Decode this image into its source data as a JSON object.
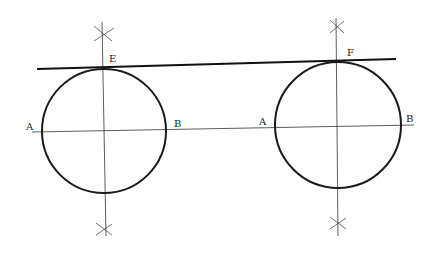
{
  "diagram": {
    "labels": {
      "left_A": "A",
      "left_B": "B",
      "E": "E",
      "right_A": "A",
      "right_B": "B",
      "F": "F"
    },
    "stroke_color": "#1a1a1a",
    "background": "#ffffff",
    "circles": [
      {
        "name": "left",
        "cx": 104,
        "cy": 131,
        "r": 62
      },
      {
        "name": "right",
        "cx": 338,
        "cy": 125,
        "r": 63
      }
    ],
    "tangent_line": {
      "x1": 37,
      "y1": 69,
      "x2": 396,
      "y2": 59
    }
  }
}
